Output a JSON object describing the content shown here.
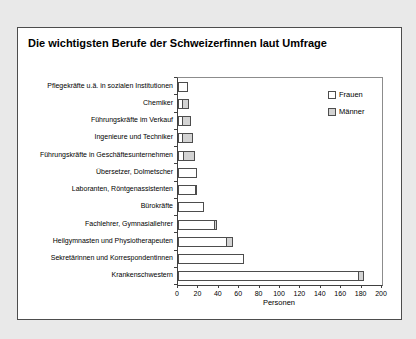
{
  "window": {
    "background_color": "#e9e9e9",
    "figure_background": "#ffffff",
    "figure_border_color": "#4d4d4d"
  },
  "chart_data": {
    "type": "bar",
    "orientation": "horizontal",
    "stacked": true,
    "title": "Die wichtigsten Berufe der Schweizerfinnen laut Umfrage",
    "xlabel": "Personen",
    "xlim": [
      0,
      200
    ],
    "xticks": [
      0,
      20,
      40,
      60,
      80,
      100,
      120,
      140,
      160,
      180,
      200
    ],
    "grid": false,
    "legend_position": "top-right-inside",
    "bar_border_color": "#4d4d4d",
    "categories": [
      "Pflegekräfte u.ä. in sozialen Institutionen",
      "Chemiker",
      "Führungskräfte im Verkauf",
      "Ingenieure und Techniker",
      "Führungskräfte in Geschäftesunternehmen",
      "Übersetzer, Dolmetscher",
      "Laboranten, Röntgenassistenten",
      "Bürokräfte",
      "Fachlehrer, Gymnasiallehrer",
      "Heilgymnasten und Physiotherapeuten",
      "Sekretärinnen und Korrespondentinnen",
      "Krankenschwestern"
    ],
    "series": [
      {
        "name": "Frauen",
        "color": "#ffffff",
        "values": [
          10,
          5,
          5,
          5,
          6,
          19,
          18,
          25,
          36,
          48,
          65,
          177
        ]
      },
      {
        "name": "Männer",
        "color": "#d3d3d3",
        "values": [
          0,
          7,
          9,
          11,
          12,
          0,
          2,
          0,
          3,
          7,
          0,
          6
        ]
      }
    ]
  }
}
